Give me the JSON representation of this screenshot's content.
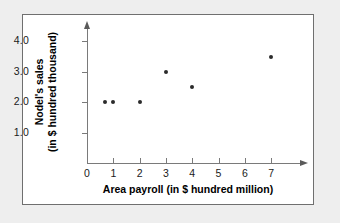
{
  "chart_data": {
    "type": "scatter",
    "title": "",
    "xlabel": "Area payroll (in $ hundred million)",
    "ylabel_line1": "Nodel's sales",
    "ylabel_line2": "(in $ hundred thousand)",
    "x": [
      0.7,
      1.0,
      2.0,
      3.0,
      4.0,
      7.0
    ],
    "y": [
      2.0,
      2.0,
      2.0,
      3.0,
      2.5,
      3.5
    ],
    "points": [
      {
        "x": 0.7,
        "y": 2.0
      },
      {
        "x": 1.0,
        "y": 2.0
      },
      {
        "x": 2.0,
        "y": 2.0
      },
      {
        "x": 3.0,
        "y": 3.0
      },
      {
        "x": 4.0,
        "y": 2.5
      },
      {
        "x": 7.0,
        "y": 3.5
      }
    ],
    "xlim": [
      0,
      7.8
    ],
    "ylim": [
      0,
      4.6
    ],
    "xticks": [
      "0",
      "1",
      "2",
      "3",
      "4",
      "5",
      "6",
      "7"
    ],
    "xtick_values": [
      0,
      1,
      2,
      3,
      4,
      5,
      6,
      7
    ],
    "yticks": [
      "1.0",
      "2.0",
      "3.0",
      "4.0"
    ],
    "ytick_values": [
      1.0,
      2.0,
      3.0,
      4.0
    ],
    "grid": false,
    "legend": "none",
    "marker_color": "#2b2b2b",
    "axis_color": "#7a7a7a",
    "background": "#ffffff",
    "page_background": "#eeeeee",
    "border_color": "#6f6f6f"
  }
}
